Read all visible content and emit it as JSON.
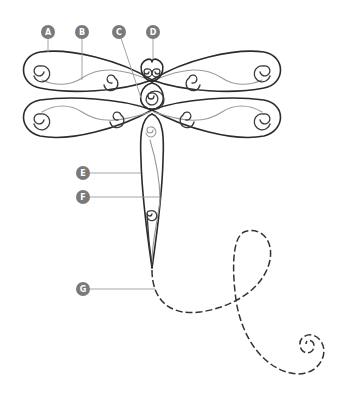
{
  "diagram": {
    "colors": {
      "wire": "#2b2b2b",
      "light_wire": "#9a9a9a",
      "badge": "#7a7a7a",
      "badge_text": "#ffffff",
      "leader": "#9a9a9a",
      "background": "#ffffff"
    },
    "labels": [
      {
        "id": "A",
        "text": "A",
        "part": "upper wing outer frame"
      },
      {
        "id": "B",
        "text": "B",
        "part": "wing inner vein"
      },
      {
        "id": "C",
        "text": "C",
        "part": "thorax scroll"
      },
      {
        "id": "D",
        "text": "D",
        "part": "head"
      },
      {
        "id": "E",
        "text": "E",
        "part": "abdomen outer wire"
      },
      {
        "id": "F",
        "text": "F",
        "part": "abdomen inner vein"
      },
      {
        "id": "G",
        "text": "G",
        "part": "dashed tail loop"
      }
    ]
  }
}
